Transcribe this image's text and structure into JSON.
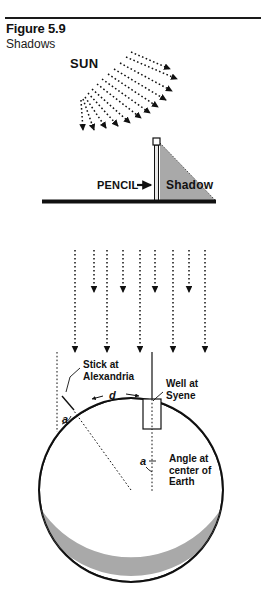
{
  "figure": {
    "number_label": "Figure 5.9",
    "caption": "Shadows",
    "divider": "horizontal-rule"
  },
  "panels": {
    "sun_panel": {
      "sun_label": "SUN",
      "ray_style": "dotted-arrow",
      "ray_count": 12,
      "description": "diverging sun rays"
    },
    "pencil_panel": {
      "pencil_label": "PENCIL",
      "pencil_arrow": "→",
      "shadow_label": "Shadow",
      "ground_line": "ground",
      "shadow_fill": "#a9a9a9"
    },
    "parallel_panel": {
      "ray_style": "dotted-arrow",
      "ray_count": 9,
      "description": "parallel sun rays"
    },
    "earth_panel": {
      "stick_label_line1": "Stick at",
      "stick_label_line2": "Alexandria",
      "well_label_line1": "Well at",
      "well_label_line2": "Syene",
      "angle_label_line1": "Angle at",
      "angle_label_line2": "center of",
      "angle_label_line3": "Earth",
      "distance_symbol": "d",
      "angle_symbol_top": "a",
      "angle_symbol_center": "a",
      "earth_fill": "#ffffff",
      "earth_shade_fill": "#a9a9a9",
      "outline_color": "#111111"
    }
  },
  "colors": {
    "ink": "#111111",
    "gray": "#a9a9a9",
    "paper": "#ffffff"
  }
}
